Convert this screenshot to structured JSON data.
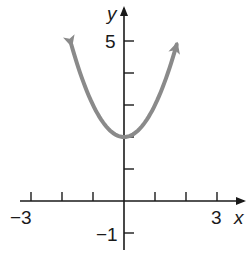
{
  "chart_data": {
    "type": "line",
    "title": "",
    "xlabel": "x",
    "ylabel": "y",
    "function": "y = x^2 + 2",
    "xlim": [
      -3.3,
      3.8
    ],
    "ylim": [
      -1.5,
      6
    ],
    "x_tick_values": [
      -3,
      -2,
      -1,
      1,
      2,
      3
    ],
    "y_tick_values": [
      -1,
      1,
      2,
      3,
      4,
      5
    ],
    "x_tick_labels": [
      "-3",
      "3"
    ],
    "y_tick_labels": [
      "5",
      "-1"
    ],
    "grid": false,
    "legend": null,
    "series": [
      {
        "name": "parabola",
        "color": "#8a8a8a",
        "arrows_at_ends": true,
        "x": [
          -1.7,
          -1.5,
          -1.25,
          -1.0,
          -0.75,
          -0.5,
          -0.25,
          0,
          0.25,
          0.5,
          0.75,
          1.0,
          1.25,
          1.5,
          1.7
        ],
        "y": [
          4.89,
          4.25,
          3.5625,
          3.0,
          2.5625,
          2.25,
          2.0625,
          2.0,
          2.0625,
          2.25,
          2.5625,
          3.0,
          3.5625,
          4.25,
          4.89
        ]
      }
    ],
    "vertex": [
      0,
      2
    ]
  },
  "labels": {
    "x_axis": "x",
    "y_axis": "y",
    "x_min_tick": "−3",
    "x_max_tick": "3",
    "y_top_tick": "5",
    "y_bottom_tick": "−1"
  },
  "colors": {
    "axis": "#1a1a1a",
    "curve": "#8a8a8a"
  }
}
